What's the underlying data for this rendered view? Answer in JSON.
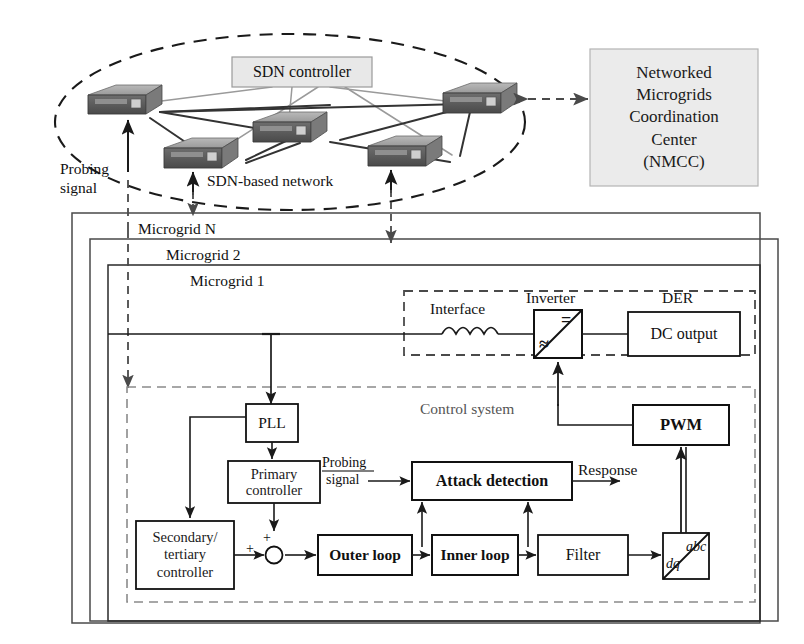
{
  "network": {
    "controller_label": "SDN controller",
    "network_label": "SDN-based network",
    "probing_label_line1": "Probing",
    "probing_label_line2": "signal",
    "node_count": 5,
    "node_icon": "router-icon",
    "controller_fill": "#e8e8e8"
  },
  "nmcc": {
    "line1": "Networked",
    "line2": "Microgrids",
    "line3": "Coordination",
    "line4": "Center",
    "line5": "(NMCC)",
    "fill": "#ebebeb"
  },
  "microgrids": {
    "layer_n": "Microgrid N",
    "layer_2": "Microgrid 2",
    "layer_1": "Microgrid 1"
  },
  "power_stage": {
    "interface_label": "Interface",
    "inverter_label": "Inverter",
    "der_label": "DER",
    "dc_output_label": "DC output",
    "inverter_ac_symbol": "≈",
    "inverter_dc_symbol": "="
  },
  "control": {
    "system_label": "Control system",
    "pll": "PLL",
    "primary_line1": "Primary",
    "primary_line2": "controller",
    "secondary_line1": "Secondary/",
    "secondary_line2": "tertiary",
    "secondary_line3": "controller",
    "attack_detection": "Attack detection",
    "pwm": "PWM",
    "outer_loop": "Outer loop",
    "inner_loop": "Inner loop",
    "filter": "Filter",
    "transform_top": "abc",
    "transform_bottom": "dq",
    "probing_line1": "Probing",
    "probing_line2": "signal",
    "response": "Response",
    "sum_sign_left": "+",
    "sum_sign_top": "+"
  },
  "colors": {
    "line": "#1a1a1a",
    "gray_line": "#8c8c8c",
    "router_top": "#a8a8a8",
    "router_front": "#5a5a5a",
    "router_side": "#7d7d7d",
    "fill_light": "#ebebeb"
  }
}
